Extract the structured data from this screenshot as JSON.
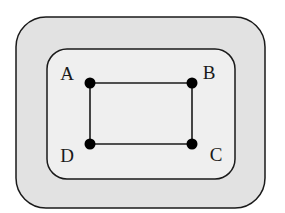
{
  "diagram": {
    "type": "graph-in-nested-regions",
    "colors": {
      "outer_fill": "#e2e2e2",
      "inner_fill": "#efefef",
      "stroke": "#1a1a1a",
      "node": "#000000"
    },
    "outer_region": {
      "x": 16,
      "y": 17,
      "w": 249,
      "h": 191,
      "r": 30
    },
    "inner_region": {
      "x": 47,
      "y": 49,
      "w": 188,
      "h": 130,
      "r": 20
    },
    "nodes": [
      {
        "id": "A",
        "label": "A",
        "x": 90,
        "y": 83,
        "label_x": 67,
        "label_y": 80
      },
      {
        "id": "B",
        "label": "B",
        "x": 192,
        "y": 83,
        "label_x": 209,
        "label_y": 79
      },
      {
        "id": "C",
        "label": "C",
        "x": 192,
        "y": 144,
        "label_x": 216,
        "label_y": 161
      },
      {
        "id": "D",
        "label": "D",
        "x": 90,
        "y": 144,
        "label_x": 67,
        "label_y": 162
      }
    ],
    "edges": [
      {
        "from": "A",
        "to": "B"
      },
      {
        "from": "B",
        "to": "C"
      },
      {
        "from": "C",
        "to": "D"
      },
      {
        "from": "D",
        "to": "A"
      }
    ]
  }
}
